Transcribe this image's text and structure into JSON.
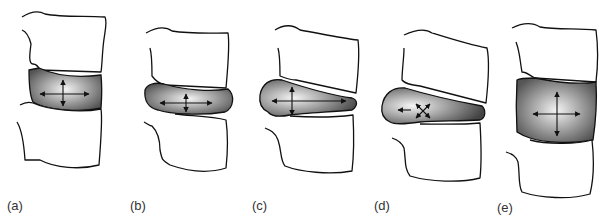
{
  "figure": {
    "panels": [
      {
        "id": "a",
        "label": "(a)",
        "description": "Normal disc with balanced pressure"
      },
      {
        "id": "b",
        "label": "(b)",
        "description": "Compressed disc bulging on both sides"
      },
      {
        "id": "c",
        "label": "(c)",
        "description": "Disc displaced anteriorly under flexion"
      },
      {
        "id": "d",
        "label": "(d)",
        "description": "Disc herniation with nucleus pushing outward"
      },
      {
        "id": "e",
        "label": "(e)",
        "description": "Distracted disc with increased height"
      }
    ]
  },
  "colors": {
    "disc_center": "#f2f2f2",
    "disc_edge": "#555555",
    "outline": "#111111"
  }
}
